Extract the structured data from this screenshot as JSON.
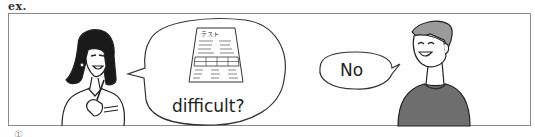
{
  "exercise": {
    "label": "ex.",
    "next_item_marker": "①"
  },
  "panel": {
    "characters": [
      {
        "role": "woman-speaker",
        "description": "woman with dark hair holding a pen"
      },
      {
        "role": "man-speaker",
        "description": "smiling young man in dark sweater"
      }
    ],
    "bubbles": [
      {
        "speaker": "woman",
        "image": "test-paper",
        "image_title": "テスト",
        "text": "difficult?"
      },
      {
        "speaker": "man",
        "text": "No"
      }
    ]
  },
  "colors": {
    "frame": "#8a8a8a",
    "ink": "#222222",
    "sweater": "#6a6a6a",
    "hair_man": "#9a9a9a"
  }
}
